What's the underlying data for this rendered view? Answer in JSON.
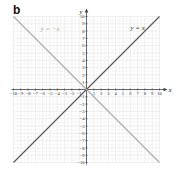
{
  "panel_label": "b",
  "chart_data": {
    "type": "line",
    "title": "",
    "xlabel": "x",
    "ylabel": "y",
    "xlim": [
      -10,
      10
    ],
    "ylim": [
      -10,
      10
    ],
    "grid": true,
    "x_ticks": [
      -10,
      -9,
      -8,
      -7,
      -6,
      -5,
      -4,
      -3,
      -2,
      -1,
      1,
      2,
      3,
      4,
      5,
      6,
      7,
      8,
      9,
      10
    ],
    "y_ticks": [
      -10,
      -9,
      -8,
      -7,
      -6,
      -5,
      -4,
      -3,
      -2,
      -1,
      1,
      2,
      3,
      4,
      5,
      6,
      7,
      8,
      9,
      10
    ],
    "series": [
      {
        "name": "y = x",
        "label": "y = x",
        "color": "#555555",
        "points": [
          [
            -10,
            -10
          ],
          [
            10,
            10
          ]
        ]
      },
      {
        "name": "y = -x",
        "label": "y = −x",
        "color": "#aaaaaa",
        "points": [
          [
            -10,
            10
          ],
          [
            10,
            -10
          ]
        ]
      }
    ],
    "annotations": [
      {
        "text": "y = −x",
        "x": -5,
        "y": 8,
        "color": "#aaaaaa"
      },
      {
        "text": "y = x",
        "x": 7,
        "y": 8.2,
        "color": "#333333"
      }
    ],
    "legend": "none (inline labels)"
  },
  "colors": {
    "grid": "#e4e4e4",
    "axis": "#444444",
    "line_y_eq_x": "#555555",
    "line_y_eq_neg_x": "#aaaaaa"
  }
}
